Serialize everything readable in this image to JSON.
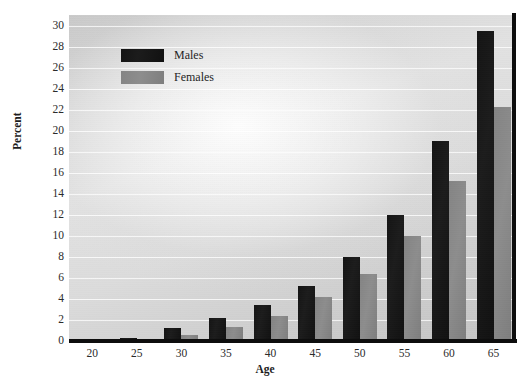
{
  "chart_data": {
    "type": "bar",
    "title": "",
    "xlabel": "Age",
    "ylabel": "Percent",
    "categories": [
      "20",
      "25",
      "30",
      "35",
      "40",
      "45",
      "50",
      "55",
      "60",
      "65"
    ],
    "series": [
      {
        "name": "Males",
        "color": "#161616",
        "values": [
          0.0,
          0.3,
          1.2,
          2.2,
          3.4,
          5.2,
          8.0,
          12.0,
          19.0,
          29.5
        ]
      },
      {
        "name": "Females",
        "color": "#888888",
        "values": [
          0.0,
          0.15,
          0.6,
          1.3,
          2.4,
          4.2,
          6.4,
          10.0,
          15.2,
          22.3
        ]
      }
    ],
    "ylim": [
      0,
      31
    ],
    "yticks": [
      0,
      2,
      4,
      6,
      8,
      10,
      12,
      14,
      16,
      18,
      20,
      22,
      24,
      26,
      28,
      30
    ],
    "ytick_labels": [
      "0",
      "2",
      "4",
      "6",
      "8",
      "10",
      "12",
      "14",
      "16",
      "18",
      "20",
      "22",
      "24",
      "26",
      "28",
      "30"
    ],
    "xtick_labels": [
      "20",
      "25",
      "30",
      "35",
      "40",
      "45",
      "50",
      "55",
      "60",
      "65"
    ],
    "grid": true,
    "grid_color": "#ffffff",
    "legend_position": "upper-left-inside",
    "legend": [
      {
        "label": "Males",
        "swatch": "#161616"
      },
      {
        "label": "Females",
        "swatch": "#888888"
      }
    ],
    "plot_background": "#d8d8d8",
    "axis_color": "#0d0d0d"
  }
}
